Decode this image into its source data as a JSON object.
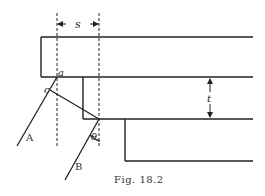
{
  "figure": {
    "caption": "Fig. 18.2",
    "labels": {
      "s": "s",
      "t": "t",
      "a": "a",
      "c": "c",
      "A": "A",
      "B": "B",
      "theta": "θ"
    },
    "colors": {
      "line": "#222222",
      "background": "#ffffff"
    }
  }
}
